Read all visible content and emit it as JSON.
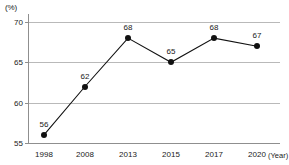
{
  "chart_data": {
    "type": "line",
    "title": "",
    "xlabel": "(Year)",
    "ylabel": "(%)",
    "categories": [
      "1998",
      "2008",
      "2013",
      "2015",
      "2017",
      "2020"
    ],
    "values": [
      56,
      62,
      68,
      65,
      68,
      67
    ],
    "point_labels": [
      "56",
      "62",
      "68",
      "65",
      "68",
      "67"
    ],
    "yticks": [
      "70",
      "65",
      "60",
      "55"
    ],
    "ytick_values": [
      70,
      65,
      60,
      55
    ],
    "ylim": [
      55,
      70
    ],
    "grid": true,
    "legend": null,
    "series_color": "#111111",
    "grid_color": "#b9b9b9",
    "axis_color": "#8f8f8f",
    "text_color": "#1a1a1a"
  }
}
